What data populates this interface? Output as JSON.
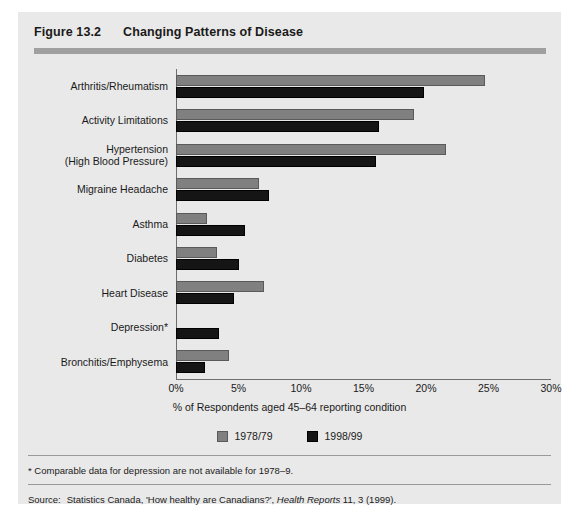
{
  "figure": {
    "number": "Figure 13.2",
    "title": "Changing Patterns of Disease"
  },
  "footnote": "* Comparable data for depression are not available for 1978–9.",
  "source": {
    "label": "Source:",
    "text_before": "Statistics Canada, 'How healthy are Canadians?', ",
    "italic": "Health Reports",
    "text_after": " 11, 3 (1999)."
  },
  "legend": {
    "position": "bottom-center",
    "items": [
      {
        "label": "1978/79",
        "color": "#808080"
      },
      {
        "label": "1998/99",
        "color": "#151515"
      }
    ]
  },
  "chart_data": {
    "type": "bar",
    "orientation": "horizontal",
    "title": "Changing Patterns of Disease",
    "xlabel": "% of Respondents aged 45–64 reporting condition",
    "ylabel": "",
    "xlim": [
      0,
      30
    ],
    "grid": false,
    "xticks": [
      "0%",
      "5%",
      "10%",
      "15%",
      "20%",
      "25%",
      "30%"
    ],
    "xtick_values": [
      0,
      5,
      10,
      15,
      20,
      25,
      30
    ],
    "categories": [
      "Arthritis/Rheumatism",
      "Activity Limitations",
      "Hypertension\n(High Blood Pressure)",
      "Migraine Headache",
      "Asthma",
      "Diabetes",
      "Heart Disease",
      "Depression*",
      "Bronchitis/Emphysema"
    ],
    "series": [
      {
        "name": "1978/79",
        "color": "#808080",
        "values": [
          24.7,
          19.0,
          21.6,
          6.6,
          2.5,
          3.3,
          7.0,
          null,
          4.2
        ]
      },
      {
        "name": "1998/99",
        "color": "#151515",
        "values": [
          19.8,
          16.2,
          16.0,
          7.4,
          5.5,
          5.0,
          4.6,
          3.4,
          2.3
        ]
      }
    ]
  }
}
